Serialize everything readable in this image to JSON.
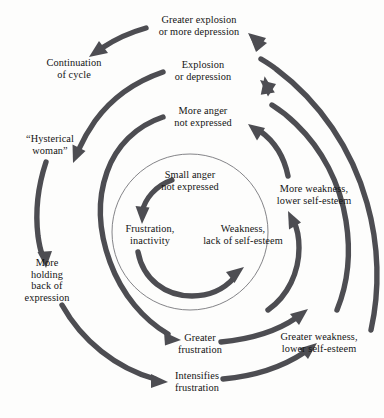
{
  "diagram": {
    "type": "spiral-cycle-diagram",
    "background_color": "#fdfdfc",
    "stroke_color": "#4d4d52",
    "thin_circle_color": "#6e6e72",
    "text_color": "#141414",
    "nodes": [
      {
        "id": "small-anger",
        "lines": [
          "Small anger",
          "not expressed"
        ],
        "ring": "inner",
        "x": 190,
        "y": 181
      },
      {
        "id": "frustration-inactivity",
        "lines": [
          "Frustration,",
          "inactivity"
        ],
        "ring": "inner",
        "x": 150,
        "y": 235
      },
      {
        "id": "weakness-lack-self-esteem",
        "lines": [
          "Weakness,",
          "lack of self-esteem"
        ],
        "ring": "inner",
        "x": 240,
        "y": 235
      },
      {
        "id": "more-anger",
        "lines": [
          "More anger",
          "not expressed"
        ],
        "ring": "middle",
        "x": 203,
        "y": 117
      },
      {
        "id": "greater-frustration",
        "lines": [
          "Greater",
          "frustration"
        ],
        "ring": "middle",
        "x": 190,
        "y": 344
      },
      {
        "id": "more-weakness",
        "lines": [
          "More weakness,",
          "lower self-esteem"
        ],
        "ring": "middle",
        "x": 314,
        "y": 195
      },
      {
        "id": "explosion-depression",
        "lines": [
          "Explosion",
          "or depression"
        ],
        "ring": "outer",
        "x": 203,
        "y": 71
      },
      {
        "id": "intensifies-frustration",
        "lines": [
          "Intensifies",
          "frustration"
        ],
        "ring": "outer",
        "x": 190,
        "y": 382
      },
      {
        "id": "greater-weakness",
        "lines": [
          "Greater weakness,",
          "lower self-esteem"
        ],
        "ring": "outer",
        "x": 319,
        "y": 343
      },
      {
        "id": "greater-explosion",
        "lines": [
          "Greater explosion",
          "or more depression"
        ],
        "ring": "outermost",
        "x": 199,
        "y": 26
      },
      {
        "id": "continuation-of-cycle",
        "lines": [
          "Continuation",
          "of cycle"
        ],
        "ring": "outermost",
        "x": 74,
        "y": 69
      },
      {
        "id": "hysterical-woman",
        "lines": [
          "“Hysterical",
          "woman”"
        ],
        "ring": "outer",
        "x": 50,
        "y": 145
      },
      {
        "id": "more-holding-back",
        "lines": [
          "More",
          "holding",
          "back of",
          "expression"
        ],
        "ring": "outer",
        "x": 47,
        "y": 280
      }
    ],
    "inner_circle": {
      "center_x": 190,
      "center_y": 232,
      "radius": 78
    },
    "arrows": [
      {
        "id": "arrow-small-anger-to-frustration",
        "ring": "inner",
        "label": "Small anger not expressed to Frustration"
      },
      {
        "id": "arrow-frustration-to-weakness",
        "ring": "inner",
        "label": "Frustration to Weakness"
      },
      {
        "id": "arrow-weakness-to-more-weakness",
        "ring": "middle",
        "label": "Weakness to More weakness"
      },
      {
        "id": "arrow-more-weakness-to-more-anger",
        "ring": "middle",
        "label": "More weakness to More anger"
      },
      {
        "id": "arrow-more-anger-to-greater-frustration",
        "ring": "middle",
        "label": "More anger to Greater frustration"
      },
      {
        "id": "arrow-greater-frustration-to-greater-weakness",
        "ring": "outer",
        "label": "Greater frustration to Greater weakness"
      },
      {
        "id": "arrow-greater-weakness-to-explosion",
        "ring": "outer",
        "label": "Greater weakness to Explosion or depression"
      },
      {
        "id": "arrow-explosion-to-hysterical",
        "ring": "outer",
        "label": "Explosion to Hysterical woman"
      },
      {
        "id": "arrow-hysterical-to-more-holding",
        "ring": "outer",
        "label": "Hysterical woman to More holding back"
      },
      {
        "id": "arrow-more-holding-to-intensifies",
        "ring": "outermost",
        "label": "More holding back to Intensifies frustration"
      },
      {
        "id": "arrow-intensifies-to-greater-weakness",
        "ring": "outermost",
        "label": "Intensifies frustration to Greater weakness"
      },
      {
        "id": "arrow-greater-weakness-to-greater-explosion",
        "ring": "outermost",
        "label": "Greater weakness to Greater explosion"
      },
      {
        "id": "arrow-greater-explosion-to-continuation",
        "ring": "outermost",
        "label": "Greater explosion to Continuation of cycle"
      }
    ]
  }
}
